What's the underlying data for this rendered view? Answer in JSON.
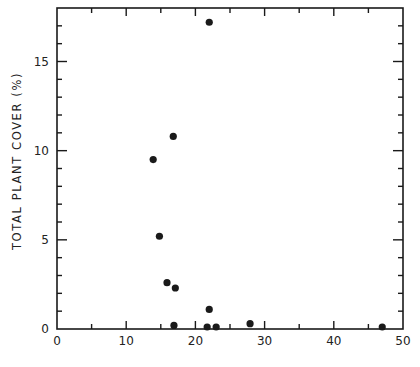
{
  "chart_data": {
    "type": "scatter",
    "title": "",
    "xlabel": "",
    "ylabel": "TOTAL PLANT COVER (%)",
    "xlim": [
      0,
      50
    ],
    "ylim": [
      0,
      18
    ],
    "x_ticks": [
      0,
      10,
      20,
      30,
      40,
      50
    ],
    "x_tick_labels": [
      "0",
      "10",
      "20",
      "30",
      "40",
      "50"
    ],
    "y_ticks": [
      0,
      5,
      10,
      15
    ],
    "y_tick_labels": [
      "0",
      "5",
      "10",
      "15"
    ],
    "x_minor_step": 5,
    "y_minor_step": 1,
    "grid": false,
    "legend": null,
    "series": [
      {
        "name": "plots",
        "points": [
          {
            "x": 22,
            "y": 17.2
          },
          {
            "x": 16.8,
            "y": 10.8
          },
          {
            "x": 13.9,
            "y": 9.5
          },
          {
            "x": 14.8,
            "y": 5.2
          },
          {
            "x": 15.9,
            "y": 2.6
          },
          {
            "x": 17.1,
            "y": 2.3
          },
          {
            "x": 22,
            "y": 1.1
          },
          {
            "x": 16.9,
            "y": 0.2
          },
          {
            "x": 21.7,
            "y": 0.05
          },
          {
            "x": 23,
            "y": 0.05
          },
          {
            "x": 27.9,
            "y": 0.3
          },
          {
            "x": 47,
            "y": 0.05
          }
        ]
      }
    ]
  },
  "colors": {
    "ink": "#1a1a1a",
    "background": "#ffffff"
  }
}
